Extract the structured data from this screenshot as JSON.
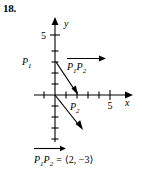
{
  "problem": {
    "number": "18."
  },
  "figure": {
    "axes": {
      "x_axis_label": "x",
      "y_axis_label": "y",
      "x_tick_label": "5",
      "y_tick_label": "5",
      "origin_px": [
        55,
        95
      ],
      "unit_px": 11,
      "x_range": [
        -1,
        7
      ],
      "y_range": [
        -4,
        6
      ],
      "x_ticks": [
        1,
        2,
        3,
        4,
        5,
        6
      ],
      "y_ticks": [
        1,
        2,
        3,
        4,
        5,
        -1,
        -2,
        -3
      ]
    },
    "points": [
      {
        "name": "P1",
        "label_base": "P",
        "label_sub": "1",
        "coords": [
          0,
          3
        ]
      },
      {
        "name": "P2",
        "label_base": "P",
        "label_sub": "2",
        "coords": [
          2,
          0
        ]
      }
    ],
    "vectors": [
      {
        "name": "vector-p1-p2",
        "from": [
          0,
          3
        ],
        "to": [
          2,
          0
        ]
      },
      {
        "name": "vector-origin-component",
        "from": [
          0,
          0
        ],
        "to": [
          2,
          -3
        ]
      }
    ],
    "inline_vector_label": {
      "name": "P1P2",
      "p_first": "P",
      "sub_first": "1",
      "p_second": "P",
      "sub_second": "2"
    }
  },
  "equation": {
    "p_first": "P",
    "sub_first": "1",
    "p_second": "P",
    "sub_second": "2",
    "equals": "=",
    "components": "⟨2, −3⟩"
  },
  "colors": {
    "ink": "#000000",
    "background": "#ffffff"
  }
}
